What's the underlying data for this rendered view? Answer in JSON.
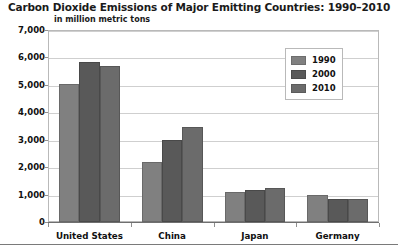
{
  "chart_data": {
    "type": "bar",
    "title": "Carbon Dioxide Emissions of Major Emitting Countries: 1990–2010",
    "subtitle": "in million metric tons",
    "xlabel": "",
    "ylabel": "",
    "ylim": [
      0,
      7000
    ],
    "ytick_values": [
      0,
      1000,
      2000,
      3000,
      4000,
      5000,
      6000,
      7000
    ],
    "ytick_labels": [
      "0",
      "1,000",
      "2,000",
      "3,000",
      "4,000",
      "5,000",
      "6,000",
      "7,000"
    ],
    "grid": true,
    "legend_position": "top-right",
    "categories": [
      "United States",
      "China",
      "Japan",
      "Germany"
    ],
    "series": [
      {
        "name": "1990",
        "color": "#808080",
        "values": [
          5050,
          2200,
          1100,
          1000
        ]
      },
      {
        "name": "2000",
        "color": "#595959",
        "values": [
          5850,
          3000,
          1180,
          840
        ]
      },
      {
        "name": "2010",
        "color": "#6b6b6b",
        "values": [
          5700,
          3450,
          1250,
          830
        ]
      }
    ]
  }
}
